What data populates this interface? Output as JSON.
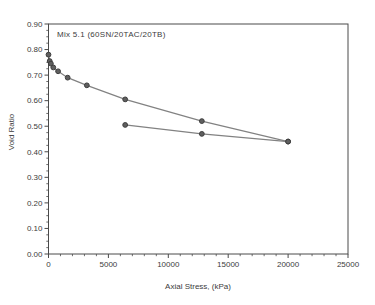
{
  "chart_data": {
    "type": "line",
    "title": "",
    "annotation": "Mix 5.1 (60SN/20TAC/20TB)",
    "xlabel": "Axial Stress, (kPa)",
    "ylabel": "Void Ratio",
    "xlim": [
      0,
      25000
    ],
    "ylim": [
      0.0,
      0.9
    ],
    "x_major_ticks": [
      0,
      5000,
      10000,
      15000,
      20000,
      25000
    ],
    "x_tick_labels": [
      "0",
      "5000",
      "10000",
      "15000",
      "20000",
      "25000"
    ],
    "x_minor_step": 1000,
    "y_major_ticks": [
      0.0,
      0.1,
      0.2,
      0.3,
      0.4,
      0.5,
      0.6,
      0.7,
      0.8,
      0.9
    ],
    "y_tick_labels": [
      "0.00",
      "0.10",
      "0.20",
      "0.30",
      "0.40",
      "0.50",
      "0.60",
      "0.70",
      "0.80",
      "0.90"
    ],
    "y_minor_step": 0.025,
    "grid": false,
    "legend": null,
    "series": [
      {
        "name": "loading",
        "x": [
          0,
          100,
          200,
          400,
          800,
          1600,
          3200,
          6400,
          12800,
          20000
        ],
        "y": [
          0.78,
          0.755,
          0.745,
          0.73,
          0.715,
          0.69,
          0.66,
          0.605,
          0.52,
          0.44
        ]
      },
      {
        "name": "unloading",
        "x": [
          20000,
          12800,
          6400
        ],
        "y": [
          0.44,
          0.47,
          0.505
        ]
      }
    ],
    "colors": {
      "line": "#828282",
      "marker_fill": "#5f5f5f",
      "marker_edge": "#3d3d3d",
      "axis": "#4a4a4a",
      "text": "#3c3c3c",
      "background": "#ffffff"
    }
  }
}
